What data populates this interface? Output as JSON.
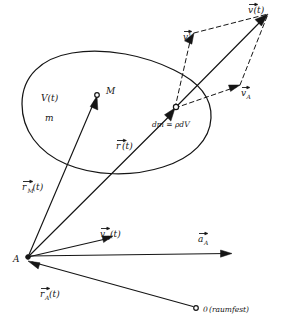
{
  "figure": {
    "language": "de",
    "background_color": "#ffffff",
    "ink_color": "#151515"
  },
  "labels": {
    "volume": "V(t)",
    "mass": "m",
    "material_point": "M",
    "mass_element": "dm = ρdV",
    "position_vector": "r̄(t)",
    "position_vector_M": "r̄ₘ(t)",
    "position_vector_A": "r̄ₐ(t)",
    "velocity_total": "v̄(t)",
    "velocity_relative": "v̄'",
    "velocity_A_parallelogram": "v̄ₐ",
    "velocity_A_at_point": "v̄ₐ(t)",
    "acceleration_A": "āₐ",
    "reference_point": "A",
    "origin": "0 (raumfest)"
  },
  "label_text": {
    "volume_base": "V(t)",
    "mass_base": "m",
    "material_point_base": "M",
    "mass_element_base": "dm = ρdV",
    "r_base": "r",
    "r_arg": "(t)",
    "r_M_sub": "M",
    "r_A_sub": "A",
    "v_base": "v",
    "v_prime": "'",
    "v_arg": "(t)",
    "v_A_sub": "A",
    "a_base": "a",
    "a_A_sub": "A",
    "point_A": "A",
    "origin_number": "0",
    "origin_note": "(raumfest)"
  },
  "geometry": {
    "point_A": [
      28,
      257
    ],
    "point_M": [
      97,
      96
    ],
    "point_dm": [
      175,
      108
    ],
    "point_origin": [
      196,
      308
    ],
    "vector_tip_v_total": [
      268,
      14
    ],
    "vector_tip_v_prime": [
      194,
      33
    ],
    "vector_tip_v_A": [
      240,
      85
    ],
    "vector_tip_a_A": [
      232,
      253
    ],
    "vector_tip_v_A_at_point": [
      113,
      236
    ]
  },
  "elements": {
    "body_outline_name": "deformable-body-outline",
    "velocity_parallelogram": "velocity-parallelogram"
  }
}
